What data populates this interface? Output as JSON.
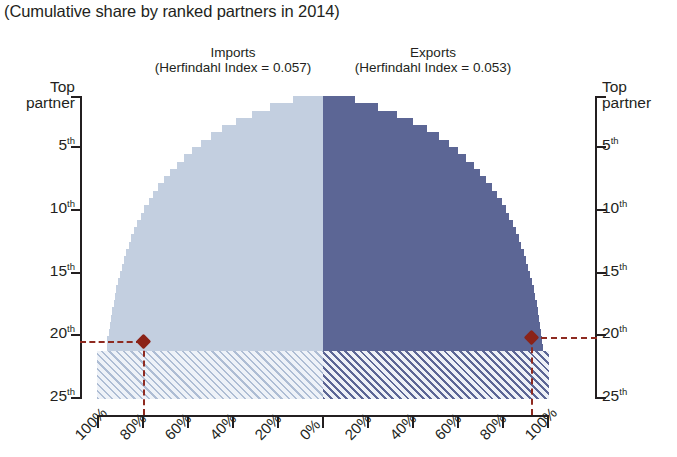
{
  "subtitle": "(Cumulative share by ranked partners in 2014)",
  "panels": {
    "imports": {
      "title": "Imports",
      "subtitle": "(Herfindahl Index = 0.057)"
    },
    "exports": {
      "title": "Exports",
      "subtitle": "(Herfindahl Index = 0.053)"
    }
  },
  "axes": {
    "y_left": {
      "top_label_line1": "Top",
      "top_label_line2": "partner",
      "ticks": [
        "Top partner",
        "5th",
        "10th",
        "15th",
        "20th",
        "25th"
      ]
    },
    "y_right": {
      "top_label_line1": "Top",
      "top_label_line2": "partner",
      "ticks": [
        "Top partner",
        "5th",
        "10th",
        "15th",
        "20th",
        "25th"
      ]
    },
    "x_labels": [
      "100%",
      "80%",
      "60%",
      "40%",
      "20%",
      "0%",
      "20%",
      "40%",
      "60%",
      "80%",
      "100%"
    ]
  },
  "colors": {
    "imports_fill": "#c3cfe0",
    "exports_fill": "#5c6695",
    "marker": "#8b2318",
    "axis": "#231f20"
  },
  "chart_data": {
    "type": "area",
    "title": "",
    "subtitle": "(Cumulative share by ranked partners in 2014)",
    "orientation": "horizontal-mirrored",
    "xlabel": "",
    "ylabel": "Ranked partner",
    "xlim": [
      -100,
      100
    ],
    "ylim": [
      1,
      25
    ],
    "grid": false,
    "legend": "none",
    "y_tick_values": [
      1,
      5,
      10,
      15,
      20,
      25
    ],
    "y_tick_labels": [
      "Top partner",
      "5th",
      "10th",
      "15th",
      "20th",
      "25th"
    ],
    "x_tick_values": [
      -100,
      -80,
      -60,
      -40,
      -20,
      0,
      20,
      40,
      60,
      80,
      100
    ],
    "x_tick_labels": [
      "100%",
      "80%",
      "60%",
      "40%",
      "20%",
      "0%",
      "20%",
      "40%",
      "60%",
      "80%",
      "100%"
    ],
    "annotations": [
      {
        "name": "imports-herfindahl",
        "label": "(Herfindahl Index = 0.057)",
        "value": 0.057
      },
      {
        "name": "exports-herfindahl",
        "label": "(Herfindahl Index = 0.053)",
        "value": 0.053
      },
      {
        "name": "imports-marker",
        "rank": 20.5,
        "cumulative_share": 20.5,
        "side": "imports"
      },
      {
        "name": "exports-marker",
        "rank": 20.0,
        "cumulative_share": 80.0,
        "side": "exports"
      }
    ],
    "series": [
      {
        "name": "Imports",
        "side": "left",
        "color": "#c3cfe0",
        "categories": [
          1,
          2,
          3,
          4,
          5,
          6,
          7,
          8,
          9,
          10,
          11,
          12,
          13,
          14,
          15,
          16,
          17,
          18,
          19,
          20,
          21,
          22,
          23,
          24,
          25,
          26,
          27,
          28,
          29,
          30,
          31,
          32,
          33,
          34,
          35
        ],
        "values": [
          13.5,
          23.5,
          31.5,
          38.5,
          44.5,
          49.5,
          54.0,
          58.0,
          61.5,
          64.8,
          67.8,
          70.5,
          73.0,
          75.2,
          77.2,
          79.0,
          80.6,
          82.1,
          83.5,
          84.8,
          86.0,
          87.1,
          88.1,
          89.0,
          89.9,
          90.7,
          91.4,
          92.1,
          92.7,
          93.3,
          93.9,
          94.4,
          94.9,
          95.4,
          95.8
        ]
      },
      {
        "name": "Exports",
        "side": "right",
        "color": "#5c6695",
        "categories": [
          1,
          2,
          3,
          4,
          5,
          6,
          7,
          8,
          9,
          10,
          11,
          12,
          13,
          14,
          15,
          16,
          17,
          18,
          19,
          20,
          21,
          22,
          23,
          24,
          25,
          26,
          27,
          28,
          29,
          30,
          31,
          32,
          33,
          34,
          35
        ],
        "values": [
          14.0,
          24.5,
          32.8,
          40.0,
          46.0,
          51.2,
          55.8,
          59.8,
          63.4,
          66.6,
          69.6,
          72.3,
          74.8,
          77.0,
          79.0,
          80.8,
          82.4,
          83.9,
          85.3,
          86.6,
          87.8,
          88.9,
          89.9,
          90.8,
          91.7,
          92.5,
          93.2,
          93.9,
          94.5,
          95.0,
          95.5,
          96.0,
          96.4,
          96.8,
          97.2
        ]
      }
    ]
  }
}
